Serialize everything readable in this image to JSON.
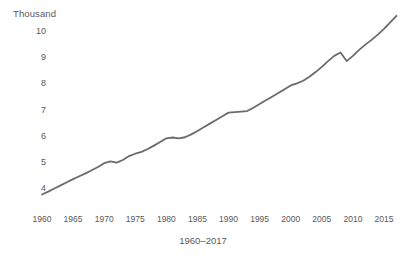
{
  "chart_data": {
    "type": "line",
    "title": "",
    "subtitle": "",
    "xlabel": "1960–2017",
    "ylabel": "Thousand",
    "unit_label": "Thousand",
    "grid": false,
    "legend": false,
    "legend_position": "none",
    "line_color": "#6b6b6b",
    "text_color": "#58595b",
    "background_color": "#ffffff",
    "xlim": [
      1960,
      2017
    ],
    "ylim": [
      3.5,
      10.8
    ],
    "x_ticks": [
      1960,
      1965,
      1970,
      1975,
      1980,
      1985,
      1990,
      1995,
      2000,
      2005,
      2010,
      2015
    ],
    "x_tick_labels": [
      "1960",
      "1965",
      "1970",
      "1975",
      "1980",
      "1985",
      "1990",
      "1995",
      "2000",
      "2005",
      "2010",
      "2015"
    ],
    "y_ticks": [
      4,
      5,
      6,
      7,
      8,
      9,
      10
    ],
    "y_tick_labels": [
      "4",
      "5",
      "6",
      "7",
      "8",
      "9",
      "10"
    ],
    "series": [
      {
        "name": "value",
        "x": [
          1960,
          1961,
          1962,
          1963,
          1964,
          1965,
          1966,
          1967,
          1968,
          1969,
          1970,
          1971,
          1972,
          1973,
          1974,
          1975,
          1976,
          1977,
          1978,
          1979,
          1980,
          1981,
          1982,
          1983,
          1984,
          1985,
          1986,
          1987,
          1988,
          1989,
          1990,
          1991,
          1992,
          1993,
          1994,
          1995,
          1996,
          1997,
          1998,
          1999,
          2000,
          2001,
          2002,
          2003,
          2004,
          2005,
          2006,
          2007,
          2008,
          2009,
          2010,
          2011,
          2012,
          2013,
          2014,
          2015,
          2016,
          2017
        ],
        "values": [
          3.75,
          3.86,
          3.98,
          4.1,
          4.22,
          4.34,
          4.45,
          4.56,
          4.68,
          4.8,
          4.95,
          5.02,
          4.97,
          5.07,
          5.22,
          5.31,
          5.38,
          5.49,
          5.62,
          5.76,
          5.9,
          5.93,
          5.9,
          5.94,
          6.05,
          6.18,
          6.32,
          6.46,
          6.6,
          6.74,
          6.88,
          6.9,
          6.92,
          6.94,
          7.07,
          7.21,
          7.35,
          7.49,
          7.63,
          7.77,
          7.92,
          8.0,
          8.1,
          8.25,
          8.43,
          8.63,
          8.85,
          9.05,
          9.18,
          8.85,
          9.05,
          9.28,
          9.48,
          9.66,
          9.86,
          10.08,
          10.33,
          10.58
        ]
      }
    ]
  },
  "axes": {
    "unit_label": "Thousand",
    "x_axis_title": "1960–2017"
  }
}
